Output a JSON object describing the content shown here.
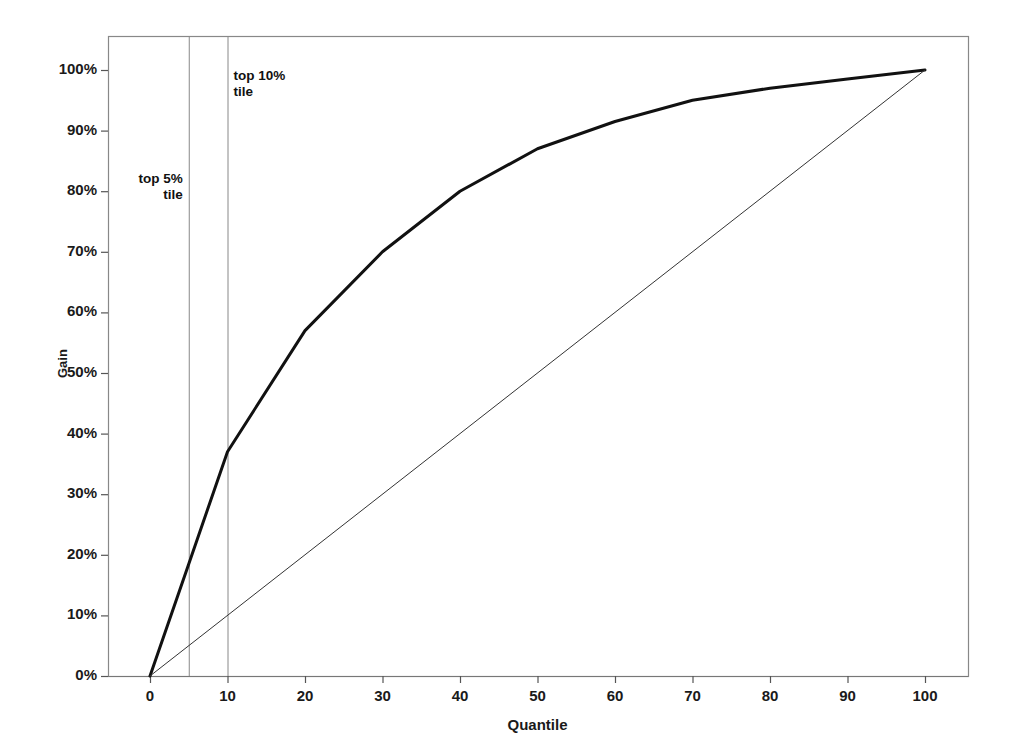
{
  "chart_data": {
    "type": "line",
    "title": "",
    "subtitle": "",
    "xlabel": "Quantile",
    "ylabel": "Gain",
    "xlim": [
      -2,
      106
    ],
    "ylim": [
      -1,
      106
    ],
    "grid": false,
    "legend_position": "none",
    "x_ticks": [
      0,
      10,
      20,
      30,
      40,
      50,
      60,
      70,
      80,
      90,
      100
    ],
    "x_tick_labels": [
      "0",
      "10",
      "20",
      "30",
      "40",
      "50",
      "60",
      "70",
      "80",
      "90",
      "100"
    ],
    "y_ticks": [
      0,
      10,
      20,
      30,
      40,
      50,
      60,
      70,
      80,
      90,
      100
    ],
    "y_tick_labels": [
      "0%",
      "10%",
      "20%",
      "30%",
      "40%",
      "50%",
      "60%",
      "70%",
      "80%",
      "90%",
      "100%"
    ],
    "series": [
      {
        "name": "Gain curve",
        "kind": "line",
        "color": "#111111",
        "width": 3,
        "x": [
          0,
          5,
          10,
          20,
          30,
          40,
          50,
          60,
          70,
          80,
          90,
          100
        ],
        "values": [
          0,
          18.5,
          37,
          57,
          70,
          80,
          87,
          91.5,
          95,
          97,
          98.5,
          100
        ]
      },
      {
        "name": "Baseline (random)",
        "kind": "line",
        "color": "#333333",
        "width": 1,
        "x": [
          0,
          100
        ],
        "values": [
          0,
          100
        ]
      }
    ],
    "reference_lines": [
      {
        "name": "top 5% tile",
        "x": 5,
        "color": "#888888",
        "width": 1
      },
      {
        "name": "top 10% tile",
        "x": 10,
        "color": "#888888",
        "width": 1
      }
    ],
    "annotations": [
      {
        "name": "top-5-annotation",
        "line1": "top 5%",
        "line2": "tile",
        "x": 5,
        "y": 82,
        "align": "right"
      },
      {
        "name": "top-10-annotation",
        "line1": "top 10%",
        "line2": "tile",
        "x": 10,
        "y": 99,
        "align": "left"
      }
    ],
    "frame_color": "#888888"
  }
}
